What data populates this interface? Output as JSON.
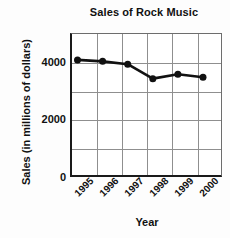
{
  "chart_data": {
    "type": "line",
    "title": "Sales of Rock Music",
    "xlabel": "Year",
    "ylabel": "Sales (in millions of dollars)",
    "categories": [
      "1995",
      "1996",
      "1997",
      "1998",
      "1999",
      "2000"
    ],
    "values": [
      4100,
      4050,
      3950,
      3450,
      3600,
      3500
    ],
    "series": [
      {
        "name": "Sales of Rock Music",
        "values": [
          4100,
          4050,
          3950,
          3450,
          3600,
          3500
        ]
      }
    ],
    "ylim": [
      0,
      5000
    ],
    "yticks": [
      0,
      2000,
      4000
    ],
    "ytick_labels": [
      "0",
      "2000",
      "4000"
    ],
    "grid": true,
    "legend": "none",
    "marker": "filled-circle",
    "line_color": "#111111",
    "marker_color": "#111111",
    "grid_color": "#8f8f8f",
    "axis_color": "#1a1a1a",
    "background": "#ffffff"
  }
}
